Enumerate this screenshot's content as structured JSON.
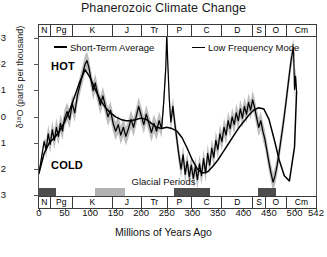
{
  "title": "Phanerozoic Climate Change",
  "axes": {
    "y_title": "δ¹⁸O (parts per thousand)",
    "x_title": "Millions of Years Ago",
    "y_ticks": [
      "-3",
      "-2",
      "-1",
      "0",
      "1",
      "2",
      "3"
    ],
    "x_ticks": [
      "0",
      "50",
      "100",
      "150",
      "200",
      "250",
      "300",
      "350",
      "400",
      "450",
      "500",
      "542"
    ]
  },
  "annotations": {
    "hot": "HOT",
    "cold": "COLD",
    "glacial": "Glacial Periods"
  },
  "legend": {
    "series1": "Short-Term Average",
    "series2": "Low Frequency Mode"
  },
  "periods": [
    {
      "label": "N",
      "start": 0,
      "end": 23
    },
    {
      "label": "Pg",
      "start": 23,
      "end": 66
    },
    {
      "label": "K",
      "start": 66,
      "end": 145
    },
    {
      "label": "J",
      "start": 145,
      "end": 201
    },
    {
      "label": "Tr",
      "start": 201,
      "end": 252
    },
    {
      "label": "P",
      "start": 252,
      "end": 299
    },
    {
      "label": "C",
      "start": 299,
      "end": 359
    },
    {
      "label": "D",
      "start": 359,
      "end": 419
    },
    {
      "label": "S",
      "start": 419,
      "end": 444
    },
    {
      "label": "O",
      "start": 444,
      "end": 485
    },
    {
      "label": "Cm",
      "start": 485,
      "end": 542
    }
  ],
  "glacial_bars": [
    {
      "start": 0,
      "end": 35,
      "color": "#4d4d4d"
    },
    {
      "start": 110,
      "end": 170,
      "color": "#b3b3b3"
    },
    {
      "start": 265,
      "end": 335,
      "color": "#4d4d4d"
    },
    {
      "start": 428,
      "end": 462,
      "color": "#4d4d4d"
    }
  ],
  "colors": {
    "line": "#000000",
    "band": "#a8a8a8",
    "frame": "#555555",
    "glacial_dark": "#4d4d4d",
    "glacial_light": "#b3b3b3"
  },
  "chart_data": {
    "type": "line",
    "title": "Phanerozoic Climate Change",
    "xlabel": "Millions of Years Ago",
    "ylabel": "δ¹⁸O (parts per thousand)",
    "xlim": [
      0,
      542
    ],
    "ylim": [
      3,
      -3
    ],
    "y_inverted": true,
    "grid": false,
    "legend_position": "top-inside",
    "series": [
      {
        "name": "Short-Term Average",
        "x": [
          0,
          5,
          10,
          14,
          18,
          22,
          26,
          30,
          34,
          38,
          42,
          46,
          50,
          55,
          60,
          65,
          70,
          75,
          80,
          85,
          90,
          94,
          98,
          102,
          106,
          110,
          115,
          120,
          125,
          130,
          135,
          140,
          145,
          150,
          155,
          160,
          165,
          170,
          175,
          180,
          185,
          190,
          195,
          200,
          205,
          210,
          215,
          220,
          225,
          230,
          235,
          240,
          244,
          248,
          250,
          252,
          255,
          258,
          262,
          266,
          270,
          274,
          278,
          282,
          286,
          290,
          294,
          298,
          302,
          306,
          310,
          314,
          318,
          322,
          326,
          330,
          334,
          338,
          342,
          346,
          350,
          354,
          358,
          362,
          366,
          370,
          374,
          378,
          382,
          386,
          390,
          394,
          398,
          402,
          406,
          410,
          414,
          418,
          422,
          426,
          430,
          434,
          438,
          442,
          446,
          450,
          454,
          458,
          462,
          466,
          470,
          474,
          478,
          482,
          486,
          490,
          494,
          498,
          500,
          502,
          504
        ],
        "y": [
          2.2,
          1.6,
          1.0,
          1.3,
          0.7,
          1.1,
          0.55,
          0.95,
          0.45,
          0.8,
          0.3,
          0.6,
          0.1,
          -0.15,
          0.15,
          -0.45,
          -0.1,
          -0.75,
          -1.15,
          -1.55,
          -1.95,
          -2.1,
          -1.8,
          -1.35,
          -0.95,
          -1.25,
          -0.8,
          -0.4,
          -0.75,
          -0.35,
          0.05,
          -0.2,
          0.3,
          0.6,
          0.35,
          0.75,
          0.45,
          0.8,
          0.5,
          0.15,
          0.45,
          0.05,
          -0.35,
          0.0,
          0.35,
          -0.05,
          0.3,
          0.65,
          0.3,
          0.6,
          0.2,
          0.5,
          -0.5,
          -1.8,
          -3.1,
          -2.0,
          -0.6,
          0.25,
          -0.35,
          0.35,
          0.95,
          1.55,
          2.05,
          1.5,
          2.25,
          1.75,
          2.35,
          1.9,
          2.4,
          1.95,
          2.45,
          1.85,
          2.3,
          1.65,
          2.2,
          1.45,
          1.9,
          1.25,
          1.6,
          0.95,
          1.3,
          0.7,
          1.0,
          0.45,
          0.75,
          0.2,
          0.5,
          0.05,
          0.35,
          -0.1,
          0.2,
          -0.25,
          0.1,
          -0.35,
          -0.05,
          -0.5,
          -0.2,
          -0.6,
          -0.3,
          0.1,
          0.45,
          0.2,
          0.6,
          0.9,
          1.35,
          1.8,
          2.2,
          2.55,
          2.3,
          1.9,
          1.4,
          0.85,
          0.3,
          -0.3,
          -0.95,
          -1.6,
          -2.2,
          -2.6,
          -1.0,
          -1.5,
          -0.9
        ]
      },
      {
        "name": "Low Frequency Mode",
        "x": [
          0,
          10,
          20,
          30,
          40,
          50,
          60,
          70,
          80,
          90,
          100,
          110,
          120,
          130,
          140,
          150,
          160,
          170,
          180,
          190,
          200,
          210,
          220,
          230,
          240,
          250,
          260,
          270,
          280,
          290,
          300,
          310,
          320,
          330,
          340,
          350,
          360,
          370,
          380,
          390,
          400,
          410,
          420,
          430,
          440,
          450,
          460,
          470,
          480,
          490,
          500,
          504
        ],
        "y": [
          2.2,
          1.45,
          1.05,
          0.85,
          0.6,
          0.25,
          -0.2,
          -0.75,
          -1.3,
          -1.75,
          -1.45,
          -1.0,
          -0.6,
          -0.3,
          -0.1,
          0.05,
          0.15,
          0.2,
          0.2,
          0.15,
          0.1,
          0.15,
          0.3,
          0.45,
          0.5,
          0.45,
          0.5,
          0.6,
          0.85,
          1.25,
          1.7,
          2.05,
          2.2,
          2.15,
          1.95,
          1.7,
          1.4,
          1.1,
          0.8,
          0.5,
          0.25,
          0.0,
          -0.2,
          -0.3,
          -0.25,
          0.15,
          0.9,
          1.7,
          2.3,
          2.5,
          1.2,
          -0.9
        ]
      }
    ],
    "uncertainty_band": {
      "name": "uncertainty envelope",
      "around": "Short-Term Average",
      "half_width": 0.35
    },
    "annotations": [
      {
        "text": "HOT",
        "x": 30,
        "y": -2.45
      },
      {
        "text": "COLD",
        "x": 30,
        "y": 1.9
      },
      {
        "text": "Glacial Periods",
        "x": 250,
        "y": 2.75
      }
    ]
  }
}
